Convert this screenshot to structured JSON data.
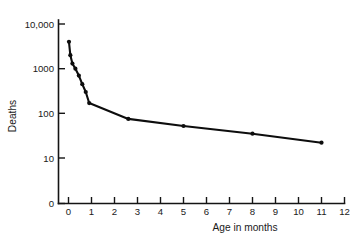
{
  "chart_data": {
    "type": "line",
    "title": "",
    "subtitle": "",
    "xlabel": "Age in months",
    "ylabel": "Deaths",
    "x": [
      0.02,
      0.08,
      0.17,
      0.3,
      0.45,
      0.6,
      0.75,
      0.9,
      2.6,
      5.0,
      8.0,
      11.0
    ],
    "values": [
      4000,
      2000,
      1300,
      1000,
      700,
      450,
      300,
      170,
      75,
      52,
      35,
      22
    ],
    "series": [
      {
        "name": "Deaths",
        "values": [
          4000,
          2000,
          1300,
          1000,
          700,
          450,
          300,
          170,
          75,
          52,
          35,
          22
        ]
      }
    ],
    "points": [
      {
        "x": 0.02,
        "y": 4000
      },
      {
        "x": 0.08,
        "y": 2000
      },
      {
        "x": 0.17,
        "y": 1300
      },
      {
        "x": 0.3,
        "y": 1000
      },
      {
        "x": 0.45,
        "y": 700
      },
      {
        "x": 0.6,
        "y": 450
      },
      {
        "x": 0.75,
        "y": 300
      },
      {
        "x": 0.9,
        "y": 170
      },
      {
        "x": 2.6,
        "y": 75
      },
      {
        "x": 5.0,
        "y": 52
      },
      {
        "x": 8.0,
        "y": 35
      },
      {
        "x": 11.0,
        "y": 22
      }
    ],
    "yticks": [
      "0",
      "10",
      "100",
      "1000",
      "10,000"
    ],
    "ytick_values": [
      0,
      10,
      100,
      1000,
      10000
    ],
    "yscale": "log-with-zero-break",
    "ylim": [
      0,
      10000
    ],
    "xticks": [
      "0",
      "1",
      "2",
      "3",
      "4",
      "5",
      "6",
      "7",
      "8",
      "9",
      "10",
      "11",
      "12"
    ],
    "xtick_values": [
      0,
      1,
      2,
      3,
      4,
      5,
      6,
      7,
      8,
      9,
      10,
      11,
      12
    ],
    "xlim": [
      0,
      12
    ],
    "grid": false,
    "legend": false,
    "legend_position": "none",
    "marker": "filled-circle",
    "line_color": "#0d0d0d",
    "axis_color": "#141414",
    "background_color": "#ffffff"
  }
}
